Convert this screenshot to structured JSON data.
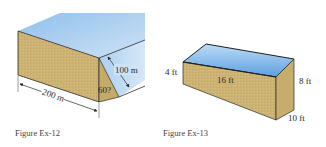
{
  "figures": [
    {
      "id": "ex-12",
      "caption": "Figure Ex-12",
      "labels": {
        "width": "100 m",
        "angle": "60?",
        "length": "200 m"
      }
    },
    {
      "id": "ex-13",
      "caption": "Figure Ex-13",
      "labels": {
        "shallow_depth": "4 ft",
        "length": "16 ft",
        "deep_depth": "8 ft",
        "width": "10 ft"
      }
    }
  ],
  "colors": {
    "water_top": "#9cc8ee",
    "water_light": "#cfe3f6",
    "earth": "#cdb274",
    "earth_dark": "#bfa463",
    "edge": "#2b2b2b"
  }
}
